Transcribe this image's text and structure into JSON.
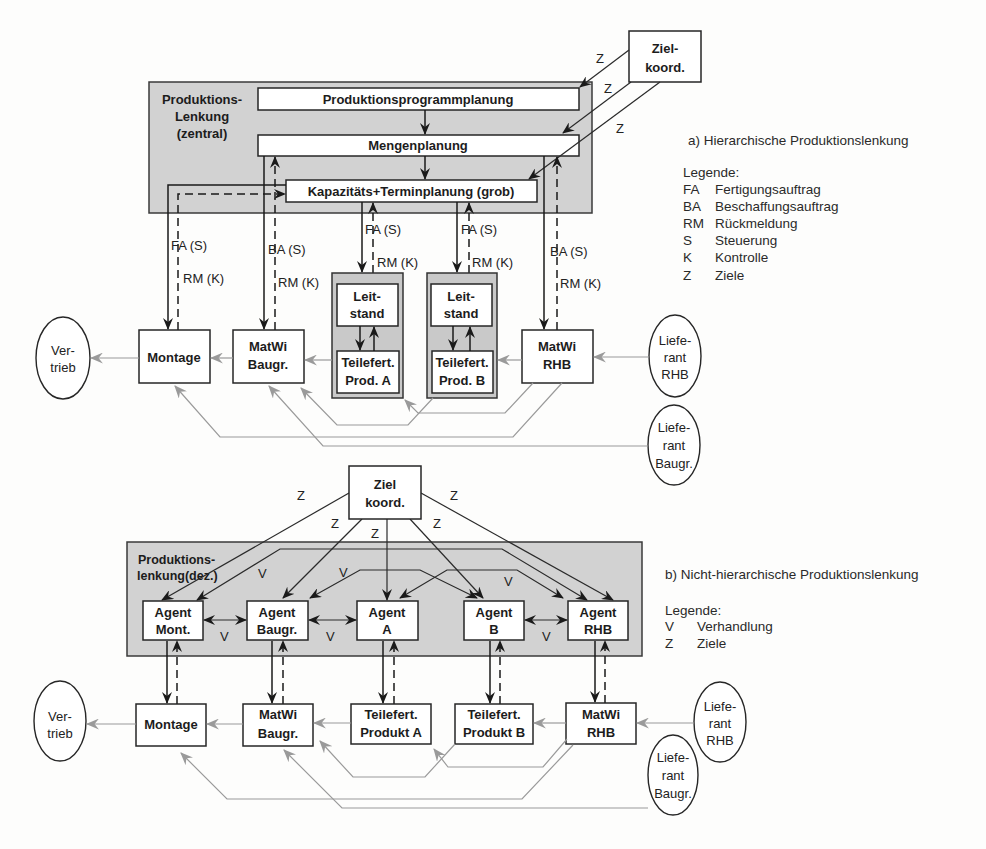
{
  "part_a": {
    "caption": "a) Hierarchische Produktionslenkung",
    "legend": {
      "title": "Legende:",
      "items": [
        {
          "abbr": "FA",
          "label": "Fertigungsauftrag"
        },
        {
          "abbr": "BA",
          "label": "Beschaffungsauftrag"
        },
        {
          "abbr": "RM",
          "label": "Rückmeldung"
        },
        {
          "abbr": "S",
          "label": "Steuerung"
        },
        {
          "abbr": "K",
          "label": "Kontrolle"
        },
        {
          "abbr": "Z",
          "label": "Ziele"
        }
      ]
    },
    "goal_coordination": {
      "lines": [
        "Ziel-",
        "koord."
      ]
    },
    "goal_edge_label": "Z",
    "central_control": {
      "lines": [
        "Produktions-",
        "Lenkung",
        "(zentral)"
      ],
      "levels": [
        "Produktionsprogrammplanung",
        "Mengenplanung",
        "Kapazitäts+Terminplanung (grob)"
      ]
    },
    "order_labels": {
      "fa": "FA (S)",
      "ba": "BA (S)",
      "rm": "RM (K)"
    },
    "nodes": {
      "vertrieb": [
        "Ver-",
        "trieb"
      ],
      "montage": [
        "Montage"
      ],
      "matwi_baugr": [
        "MatWi",
        "Baugr."
      ],
      "leitstand": [
        "Leit-",
        "stand"
      ],
      "teilefert_a": [
        "Teilefert.",
        "Prod. A"
      ],
      "teilefert_b": [
        "Teilefert.",
        "Prod. B"
      ],
      "matwi_rhb": [
        "MatWi",
        "RHB"
      ],
      "lieferant_rhb": [
        "Liefe-",
        "rant",
        "RHB"
      ],
      "lieferant_baugr": [
        "Liefe-",
        "rant",
        "Baugr."
      ]
    }
  },
  "part_b": {
    "caption": "b) Nicht-hierarchische Produktionslenkung",
    "legend": {
      "title": "Legende:",
      "items": [
        {
          "abbr": "V",
          "label": "Verhandlung"
        },
        {
          "abbr": "Z",
          "label": "Ziele"
        }
      ]
    },
    "goal_coordination": {
      "lines": [
        "Ziel",
        "koord."
      ]
    },
    "goal_edge_label": "Z",
    "negotiation_label": "V",
    "decentral_control": {
      "lines": [
        "Produktions-",
        "lenkung(dez.)"
      ]
    },
    "agents": [
      {
        "lines": [
          "Agent",
          "Mont."
        ]
      },
      {
        "lines": [
          "Agent",
          "Baugr."
        ]
      },
      {
        "lines": [
          "Agent",
          "A"
        ]
      },
      {
        "lines": [
          "Agent",
          "B"
        ]
      },
      {
        "lines": [
          "Agent",
          "RHB"
        ]
      }
    ],
    "nodes": {
      "vertrieb": [
        "Ver-",
        "trieb"
      ],
      "montage": [
        "Montage"
      ],
      "matwi_baugr": [
        "MatWi",
        "Baugr."
      ],
      "teilefert_a": [
        "Teilefert.",
        "Produkt A"
      ],
      "teilefert_b": [
        "Teilefert.",
        "Produkt B"
      ],
      "matwi_rhb": [
        "MatWi",
        "RHB"
      ],
      "lieferant_rhb": [
        "Liefe-",
        "rant",
        "RHB"
      ],
      "lieferant_baugr": [
        "Liefe-",
        "rant",
        "Baugr."
      ]
    }
  },
  "colors": {
    "control_group_fill": "#d2d2d2",
    "material_flow": "#9a9a9a",
    "control_flow": "#1a1a1a"
  }
}
